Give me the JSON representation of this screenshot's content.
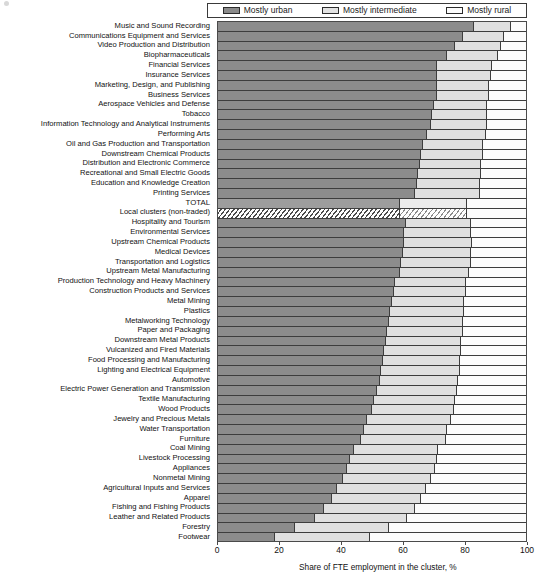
{
  "legend": {
    "position": "top",
    "items": [
      {
        "label": "Mostly urban",
        "swatch": "sw-urban",
        "color": "#8a8a8a"
      },
      {
        "label": "Mostly intermediate",
        "swatch": "sw-inter",
        "color": "#e2e2e2"
      },
      {
        "label": "Mostly rural",
        "swatch": "sw-rural",
        "color": "#fbfbfb"
      }
    ]
  },
  "axis": {
    "x_title": "Share of FTE employment in the cluster, %",
    "ticks": [
      0,
      20,
      40,
      60,
      80,
      100
    ],
    "xlim": [
      0,
      100
    ]
  },
  "chart_data": {
    "type": "bar",
    "orientation": "horizontal",
    "stacked": true,
    "title": "",
    "xlabel": "Share of FTE employment in the cluster, %",
    "ylabel": "",
    "xlim": [
      0,
      100
    ],
    "grid": false,
    "legend_position": "top",
    "series": [
      {
        "name": "Mostly urban",
        "color": "#8c8c8c"
      },
      {
        "name": "Mostly intermediate",
        "color": "#e0e0e0"
      },
      {
        "name": "Mostly rural",
        "color": "#fcfcfc"
      }
    ],
    "categories": [
      "Music and Sound Recording",
      "Communications Equipment and Services",
      "Video Production and Distribution",
      "Biopharmaceuticals",
      "Financial Services",
      "Insurance Services",
      "Marketing, Design, and Publishing",
      "Business Services",
      "Aerospace Vehicles and Defense",
      "Tobacco",
      "Information Technology and Analytical Instruments",
      "Performing Arts",
      "Oil and Gas Production and Transportation",
      "Downstream Chemical Products",
      "Distribution and Electronic Commerce",
      "Recreational and Small Electric Goods",
      "Education and Knowledge Creation",
      "Printing Services",
      "TOTAL",
      "Local clusters (non-traded)",
      "Hospitality and Tourism",
      "Environmental Services",
      "Upstream Chemical Products",
      "Medical Devices",
      "Transportation and Logistics",
      "Upstream Metal Manufacturing",
      "Production Technology and Heavy Machinery",
      "Construction Products and Services",
      "Metal Mining",
      "Plastics",
      "Metalworking Technology",
      "Paper and Packaging",
      "Downstream Metal Products",
      "Vulcanized and Fired Materials",
      "Food Processing and Manufacturing",
      "Lighting and Electrical Equipment",
      "Automotive",
      "Electric Power Generation and Transmission",
      "Textile Manufacturing",
      "Wood Products",
      "Jewelry and Precious Metals",
      "Water Transportation",
      "Furniture",
      "Coal Mining",
      "Livestock Processing",
      "Appliances",
      "Nonmetal Mining",
      "Agricultural Inputs and Services",
      "Apparel",
      "Fishing and Fishing Products",
      "Leather and Related Products",
      "Forestry",
      "Footwear"
    ],
    "values": {
      "Mostly urban": [
        83.0,
        79.5,
        77.0,
        74.5,
        71.0,
        71.0,
        71.0,
        71.0,
        70.0,
        69.5,
        69.0,
        68.0,
        66.5,
        66.0,
        65.5,
        65.0,
        64.5,
        64.0,
        59.0,
        59.0,
        61.0,
        60.5,
        60.5,
        60.0,
        59.5,
        59.0,
        57.5,
        57.0,
        56.5,
        56.0,
        55.5,
        55.0,
        54.5,
        54.0,
        53.5,
        53.0,
        52.5,
        51.5,
        50.5,
        50.0,
        48.5,
        47.5,
        46.5,
        44.0,
        43.0,
        42.0,
        40.5,
        38.5,
        37.0,
        34.5,
        31.5,
        25.0,
        18.5
      ],
      "Mostly intermediate": [
        12.0,
        13.5,
        15.0,
        16.5,
        18.0,
        17.5,
        17.0,
        17.0,
        17.5,
        18.0,
        18.5,
        19.0,
        19.5,
        20.0,
        20.0,
        20.5,
        20.5,
        21.0,
        22.0,
        22.0,
        21.0,
        21.5,
        22.0,
        22.0,
        22.5,
        22.5,
        23.0,
        23.5,
        23.5,
        24.0,
        24.0,
        24.5,
        24.5,
        25.0,
        25.0,
        25.5,
        25.5,
        26.0,
        26.5,
        26.5,
        27.0,
        27.0,
        27.5,
        27.5,
        28.0,
        28.5,
        28.5,
        29.0,
        29.0,
        29.5,
        30.0,
        30.5,
        31.0
      ],
      "Mostly rural": [
        5.0,
        7.0,
        8.0,
        9.0,
        11.0,
        11.5,
        12.0,
        12.0,
        12.5,
        12.5,
        12.5,
        13.0,
        14.0,
        14.0,
        14.5,
        14.5,
        15.0,
        15.0,
        19.0,
        19.0,
        18.0,
        18.0,
        17.5,
        18.0,
        18.0,
        18.5,
        19.5,
        19.5,
        20.0,
        20.0,
        20.5,
        20.5,
        21.0,
        21.0,
        21.5,
        21.5,
        22.0,
        22.5,
        23.0,
        23.5,
        24.5,
        25.5,
        26.0,
        28.5,
        29.0,
        29.5,
        31.0,
        32.5,
        34.0,
        36.0,
        38.5,
        44.5,
        50.5
      ]
    }
  }
}
